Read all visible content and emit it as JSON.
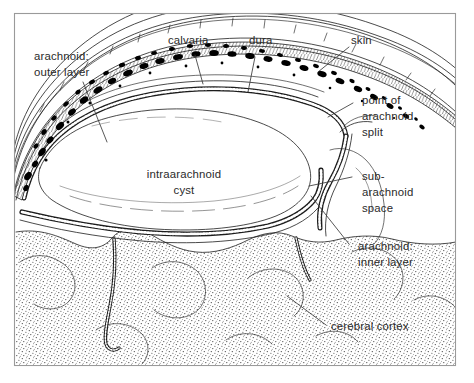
{
  "figure": {
    "title": "Intraarachnoid cyst — coronal section through scalp, calvaria, meninges and cerebral cortex",
    "border_color": "#9a9a9a",
    "ink_color": "#1d1d1d",
    "background_color": "#ffffff",
    "label_color": "#2a2a2a",
    "width": 474,
    "height": 383
  },
  "labels": {
    "arachnoid_outer": {
      "line1": "arachnoid:",
      "line2": "outer layer"
    },
    "calvaria": {
      "line1": "calvaria"
    },
    "dura": {
      "line1": "dura"
    },
    "skin": {
      "line1": "skin"
    },
    "point_of_split": {
      "line1": "point of",
      "line2": "arachnoid",
      "line3": "split"
    },
    "subarachnoid_space": {
      "line1": "sub-",
      "line2": "arachnoid",
      "line3": "space"
    },
    "arachnoid_inner": {
      "line1": "arachnoid:",
      "line2": "inner layer"
    },
    "cerebral_cortex": {
      "line1": "cerebral cortex"
    },
    "intraarachnoid_cyst": {
      "line1": "intraarachnoid",
      "line2": "cyst"
    }
  },
  "structures": [
    {
      "name": "skin",
      "description": "outermost scalp layer, thin parallel contour lines"
    },
    {
      "name": "calvaria",
      "description": "skull vault with diploic marrow, irregular black blotches"
    },
    {
      "name": "dura",
      "description": "dense membrane beneath the inner table of the skull"
    },
    {
      "name": "arachnoid-outer-layer",
      "description": "beaded membrane forming roof of the cyst"
    },
    {
      "name": "intraarachnoid-cyst",
      "description": "large clear lens-shaped cavity within split arachnoid"
    },
    {
      "name": "arachnoid-inner-layer",
      "description": "beaded membrane forming floor of the cyst over cortex"
    },
    {
      "name": "subarachnoid-space",
      "description": "space between arachnoid inner layer and pia over cortex"
    },
    {
      "name": "cerebral-cortex",
      "description": "stippled brain tissue with gyri and sulci"
    },
    {
      "name": "point-of-arachnoid-split",
      "description": "site where arachnoid divides into inner and outer leaves"
    }
  ]
}
